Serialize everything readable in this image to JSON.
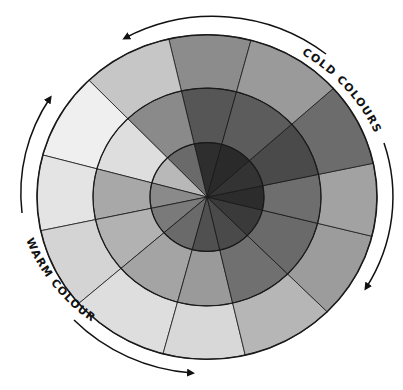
{
  "diagram": {
    "center": {
      "x": 207,
      "y": 197
    },
    "scale_y": 0.955,
    "ring_radii": {
      "outer": 170,
      "middle": 114,
      "inner": 57
    },
    "outline_color": "#1a1a1a",
    "boundary_angles_deg": [
      75,
      103,
      134,
      165,
      192,
      221,
      255,
      283,
      315,
      346,
      372,
      402
    ],
    "rings": {
      "outer": [
        "#8c8c8c",
        "#c6c6c6",
        "#efefef",
        "#e4e4e4",
        "#d4d4d4",
        "#dedede",
        "#d8d8d8",
        "#b6b6b6",
        "#9c9c9c",
        "#a2a2a2",
        "#6c6c6c",
        "#9a9a9a"
      ],
      "middle": [
        "#565656",
        "#8a8a8a",
        "#dedede",
        "#a8a8a8",
        "#b2b2b2",
        "#a4a4a4",
        "#9a9a9a",
        "#707070",
        "#6a6a6a",
        "#6e6e6e",
        "#4a4a4a",
        "#5c5c5c"
      ],
      "inner": [
        "#2e2e2e",
        "#6a6a6a",
        "#b8b8b8",
        "#8a8a8a",
        "#7a7a7a",
        "#6a6a6a",
        "#505050",
        "#4a4a4a",
        "#3a3a3a",
        "#2c2c2c",
        "#333333",
        "#2a2a2a"
      ]
    },
    "labels": {
      "cold": "COLD COLOURS",
      "warm": "WARM COLOURS"
    },
    "arrows": {
      "cold": {
        "from": "lower-right",
        "to": "top-left",
        "description": "arc arrows around cold side"
      },
      "warm": {
        "from": "upper-left",
        "to": "bottom",
        "description": "arc arrows around warm side"
      }
    }
  }
}
